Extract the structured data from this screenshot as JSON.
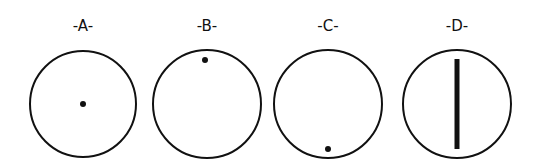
{
  "diagram": {
    "panels": [
      {
        "label": "-A-",
        "circle": {
          "cx": 83,
          "cy": 104,
          "r": 53
        },
        "mark": {
          "type": "dot",
          "cx": 83,
          "cy": 104,
          "r": 3
        }
      },
      {
        "label": "-B-",
        "circle": {
          "cx": 207,
          "cy": 104,
          "r": 54
        },
        "mark": {
          "type": "dot",
          "cx": 205,
          "cy": 60,
          "r": 3
        }
      },
      {
        "label": "-C-",
        "circle": {
          "cx": 328,
          "cy": 104,
          "r": 54
        },
        "mark": {
          "type": "dot",
          "cx": 328,
          "cy": 149,
          "r": 3
        }
      },
      {
        "label": "-D-",
        "circle": {
          "cx": 457,
          "cy": 104,
          "r": 54
        },
        "mark": {
          "type": "bar",
          "x": 457,
          "y1": 59,
          "y2": 149,
          "width": 5
        }
      }
    ],
    "stroke_color": "#111111",
    "background": "#ffffff"
  }
}
